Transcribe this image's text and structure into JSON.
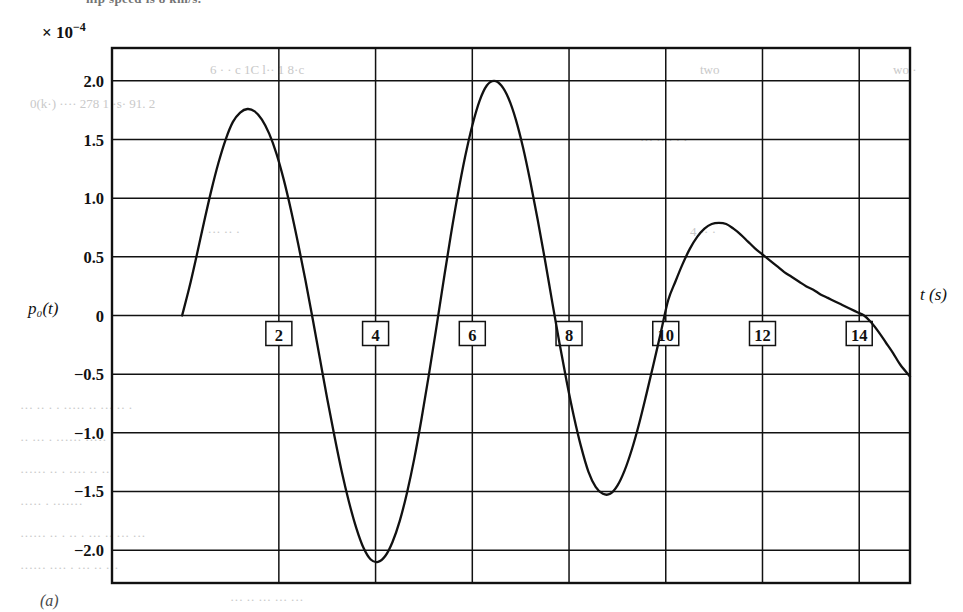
{
  "figure": {
    "panel_label": "(a)",
    "scale_label": "× 10",
    "scale_exponent": "−4",
    "bleed_top_text": "hip speed is 8 km/s."
  },
  "ghost_text": [
    {
      "text": "6 · ·  c  1C   l·· 1 8·c",
      "x": 210,
      "y": 62
    },
    {
      "text": "two",
      "x": 700,
      "y": 62
    },
    {
      "text": "0(k·)    ····   278 1 ·s·    91. 2",
      "x": 30,
      "y": 96
    },
    {
      "text": "···   ·· · · ·",
      "x": 640,
      "y": 132
    },
    {
      "text": "wo ·",
      "x": 893,
      "y": 62
    },
    {
      "text": "· ···   ·· ·",
      "x": 200,
      "y": 224
    },
    {
      "text": "4 ··  ·",
      "x": 690,
      "y": 224
    },
    {
      "text": "··· ·· · · ····· ·· ··· ·· ·",
      "x": 20,
      "y": 400
    },
    {
      "text": "·· ··· · ······ ·····",
      "x": 20,
      "y": 432
    },
    {
      "text": "······ ·· · ···· ·· ··",
      "x": 20,
      "y": 464
    },
    {
      "text": "····· · ·······",
      "x": 20,
      "y": 496
    },
    {
      "text": "······ ·· · ·· · ··· ·· ··· ···",
      "x": 20,
      "y": 528
    },
    {
      "text": "······ ···· · ··· ·· ···",
      "x": 20,
      "y": 560
    },
    {
      "text": "··· ·· ··· ··· ···",
      "x": 230,
      "y": 592
    }
  ],
  "chart_data": {
    "type": "line",
    "title": "",
    "subtitle": "",
    "xlabel": "t (s)",
    "ylabel": "p₀(t)",
    "y_scale_factor": "× 10⁻⁴",
    "xlim": [
      -1.45,
      15.05
    ],
    "ylim": [
      -2.28,
      2.28
    ],
    "grid": true,
    "legend": null,
    "xticks": [
      2,
      4,
      6,
      8,
      10,
      12,
      14
    ],
    "xtick_labels": [
      "2",
      "4",
      "6",
      "8",
      "10",
      "12",
      "14"
    ],
    "yticks": [
      2.0,
      1.5,
      1.0,
      0.5,
      0,
      -0.5,
      -1.0,
      -1.5,
      -2.0
    ],
    "ytick_labels": [
      "2.0",
      "1.5",
      "1.0",
      "0.5",
      "0",
      "−0.5",
      "−1.0",
      "−1.5",
      "−2.0"
    ],
    "series": [
      {
        "name": "p0(t)",
        "color": "#111111",
        "x": [
          0.0,
          0.15,
          0.3,
          0.45,
          0.6,
          0.75,
          0.9,
          1.05,
          1.2,
          1.35,
          1.5,
          1.65,
          1.8,
          1.95,
          2.1,
          2.25,
          2.4,
          2.55,
          2.7,
          2.85,
          3.0,
          3.15,
          3.3,
          3.45,
          3.6,
          3.75,
          3.9,
          4.05,
          4.2,
          4.35,
          4.5,
          4.65,
          4.8,
          4.95,
          5.1,
          5.25,
          5.4,
          5.55,
          5.7,
          5.85,
          6.0,
          6.15,
          6.3,
          6.45,
          6.6,
          6.75,
          6.9,
          7.05,
          7.2,
          7.35,
          7.5,
          7.65,
          7.8,
          7.95,
          8.1,
          8.25,
          8.4,
          8.55,
          8.7,
          8.85,
          9.0,
          9.15,
          9.3,
          9.45,
          9.6,
          9.75,
          9.9,
          10.05,
          10.2,
          10.35,
          10.5,
          10.65,
          10.8,
          10.95,
          11.1,
          11.25,
          11.4,
          11.55,
          11.7,
          11.85,
          12.0,
          12.15,
          12.3,
          12.45,
          12.6,
          12.75,
          12.9,
          13.05,
          13.2,
          13.35,
          13.5,
          13.65,
          13.8,
          13.95,
          14.1,
          14.25,
          14.4,
          14.55,
          14.7,
          14.85,
          15.05
        ],
        "y": [
          0.0,
          0.24,
          0.51,
          0.79,
          1.06,
          1.3,
          1.5,
          1.65,
          1.73,
          1.76,
          1.74,
          1.67,
          1.55,
          1.38,
          1.16,
          0.9,
          0.61,
          0.3,
          -0.03,
          -0.37,
          -0.71,
          -1.03,
          -1.33,
          -1.59,
          -1.81,
          -1.98,
          -2.08,
          -2.1,
          -2.05,
          -1.93,
          -1.75,
          -1.51,
          -1.22,
          -0.88,
          -0.51,
          -0.12,
          0.28,
          0.67,
          1.03,
          1.35,
          1.62,
          1.83,
          1.96,
          2.0,
          1.96,
          1.85,
          1.67,
          1.43,
          1.14,
          0.82,
          0.48,
          0.12,
          -0.23,
          -0.56,
          -0.86,
          -1.12,
          -1.33,
          -1.46,
          -1.52,
          -1.52,
          -1.45,
          -1.32,
          -1.14,
          -0.92,
          -0.67,
          -0.41,
          -0.14,
          0.13,
          0.29,
          0.44,
          0.57,
          0.67,
          0.74,
          0.78,
          0.79,
          0.78,
          0.74,
          0.69,
          0.63,
          0.57,
          0.52,
          0.47,
          0.42,
          0.37,
          0.33,
          0.29,
          0.25,
          0.22,
          0.18,
          0.15,
          0.12,
          0.09,
          0.06,
          0.03,
          0.0,
          -0.06,
          -0.14,
          -0.23,
          -0.32,
          -0.42,
          -0.52
        ],
        "annotations": [
          {
            "label": "first maximum",
            "x": 1.35,
            "y": 1.76
          },
          {
            "label": "first minimum",
            "x": 4.05,
            "y": -2.1
          },
          {
            "label": "global maximum",
            "x": 6.45,
            "y": 2.0
          },
          {
            "label": "second minimum",
            "x": 8.85,
            "y": -1.53
          },
          {
            "label": "third maximum",
            "x": 11.1,
            "y": 0.79
          },
          {
            "label": "final zero crossing",
            "x": 14.1,
            "y": 0.0
          }
        ]
      }
    ]
  }
}
